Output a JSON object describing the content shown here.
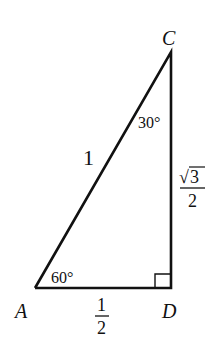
{
  "diagram": {
    "type": "right-triangle",
    "vertices": {
      "A": "A",
      "C": "C",
      "D": "D"
    },
    "sides": {
      "hypotenuse_AC": "1",
      "base_AD": {
        "numerator": "1",
        "denominator": "2"
      },
      "height_CD": {
        "numerator": "3",
        "radical": "√",
        "denominator": "2"
      }
    },
    "angles": {
      "at_A": "60°",
      "at_C": "30°",
      "at_D": "right-angle-mark"
    },
    "stroke_color": "#111111"
  }
}
